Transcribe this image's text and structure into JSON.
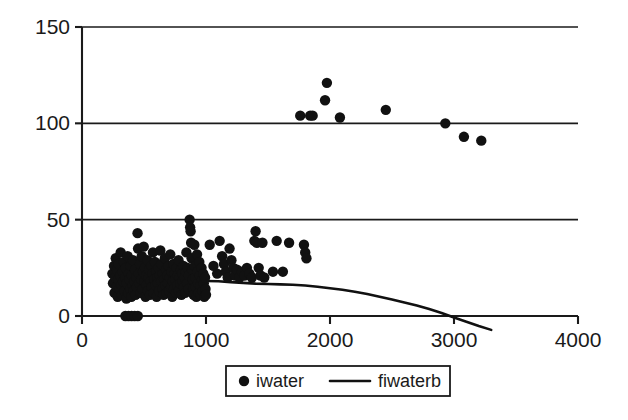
{
  "chart_data": {
    "type": "scatter",
    "title": "",
    "xlabel": "",
    "ylabel": "",
    "xlim": [
      0,
      4000
    ],
    "ylim": [
      0,
      150
    ],
    "grid": true,
    "legend_position": "bottom",
    "x_ticks": [
      0,
      1000,
      2000,
      3000,
      4000
    ],
    "x_tick_labels": [
      "0",
      "1000",
      "2000",
      "3000",
      "4000"
    ],
    "y_ticks": [
      0,
      50,
      100,
      150
    ],
    "y_tick_labels": [
      "0",
      "50",
      "100",
      "150"
    ],
    "series": [
      {
        "name": "iwater",
        "type": "scatter",
        "marker": "filled-circle",
        "color": "#111111",
        "points": [
          [
            245,
            22
          ],
          [
            250,
            17
          ],
          [
            258,
            26
          ],
          [
            262,
            12
          ],
          [
            268,
            20
          ],
          [
            272,
            30
          ],
          [
            278,
            15
          ],
          [
            283,
            24
          ],
          [
            288,
            10
          ],
          [
            292,
            19
          ],
          [
            297,
            27
          ],
          [
            302,
            14
          ],
          [
            308,
            21
          ],
          [
            312,
            33
          ],
          [
            318,
            16
          ],
          [
            322,
            11
          ],
          [
            328,
            23
          ],
          [
            332,
            18
          ],
          [
            338,
            28
          ],
          [
            342,
            13
          ],
          [
            348,
            20
          ],
          [
            352,
            25
          ],
          [
            358,
            9
          ],
          [
            362,
            17
          ],
          [
            368,
            31
          ],
          [
            372,
            12
          ],
          [
            378,
            22
          ],
          [
            382,
            19
          ],
          [
            388,
            14
          ],
          [
            392,
            26
          ],
          [
            398,
            10
          ],
          [
            402,
            21
          ],
          [
            408,
            16
          ],
          [
            412,
            29
          ],
          [
            418,
            13
          ],
          [
            422,
            18
          ],
          [
            428,
            24
          ],
          [
            432,
            11
          ],
          [
            438,
            20
          ],
          [
            442,
            15
          ],
          [
            448,
            43
          ],
          [
            452,
            35
          ],
          [
            458,
            22
          ],
          [
            462,
            17
          ],
          [
            468,
            27
          ],
          [
            472,
            12
          ],
          [
            478,
            19
          ],
          [
            482,
            31
          ],
          [
            488,
            14
          ],
          [
            492,
            23
          ],
          [
            498,
            36
          ],
          [
            502,
            18
          ],
          [
            508,
            25
          ],
          [
            512,
            10
          ],
          [
            518,
            21
          ],
          [
            522,
            16
          ],
          [
            528,
            29
          ],
          [
            532,
            13
          ],
          [
            538,
            20
          ],
          [
            542,
            24
          ],
          [
            548,
            11
          ],
          [
            552,
            18
          ],
          [
            558,
            26
          ],
          [
            562,
            15
          ],
          [
            568,
            22
          ],
          [
            572,
            33
          ],
          [
            578,
            12
          ],
          [
            582,
            19
          ],
          [
            588,
            28
          ],
          [
            592,
            16
          ],
          [
            598,
            23
          ],
          [
            602,
            10
          ],
          [
            608,
            20
          ],
          [
            612,
            17
          ],
          [
            618,
            25
          ],
          [
            622,
            13
          ],
          [
            628,
            21
          ],
          [
            632,
            34
          ],
          [
            638,
            18
          ],
          [
            642,
            27
          ],
          [
            648,
            14
          ],
          [
            652,
            22
          ],
          [
            658,
            11
          ],
          [
            662,
            19
          ],
          [
            668,
            30
          ],
          [
            672,
            16
          ],
          [
            678,
            24
          ],
          [
            682,
            12
          ],
          [
            688,
            21
          ],
          [
            692,
            17
          ],
          [
            698,
            26
          ],
          [
            702,
            13
          ],
          [
            708,
            20
          ],
          [
            712,
            32
          ],
          [
            718,
            15
          ],
          [
            722,
            23
          ],
          [
            728,
            10
          ],
          [
            732,
            18
          ],
          [
            738,
            27
          ],
          [
            742,
            14
          ],
          [
            748,
            22
          ],
          [
            752,
            19
          ],
          [
            758,
            12
          ],
          [
            762,
            25
          ],
          [
            768,
            16
          ],
          [
            772,
            21
          ],
          [
            778,
            29
          ],
          [
            782,
            13
          ],
          [
            788,
            20
          ],
          [
            792,
            17
          ],
          [
            798,
            24
          ],
          [
            802,
            11
          ],
          [
            808,
            22
          ],
          [
            812,
            18
          ],
          [
            818,
            26
          ],
          [
            822,
            15
          ],
          [
            828,
            20
          ],
          [
            832,
            12
          ],
          [
            838,
            23
          ],
          [
            842,
            33
          ],
          [
            848,
            17
          ],
          [
            852,
            25
          ],
          [
            858,
            14
          ],
          [
            862,
            21
          ],
          [
            868,
            50
          ],
          [
            872,
            46
          ],
          [
            876,
            44
          ],
          [
            880,
            38
          ],
          [
            884,
            30
          ],
          [
            888,
            24
          ],
          [
            892,
            19
          ],
          [
            896,
            14
          ],
          [
            900,
            11
          ],
          [
            906,
            37
          ],
          [
            910,
            26
          ],
          [
            914,
            20
          ],
          [
            918,
            15
          ],
          [
            922,
            10
          ],
          [
            928,
            32
          ],
          [
            932,
            23
          ],
          [
            936,
            17
          ],
          [
            940,
            12
          ],
          [
            946,
            28
          ],
          [
            950,
            21
          ],
          [
            954,
            16
          ],
          [
            958,
            11
          ],
          [
            964,
            25
          ],
          [
            968,
            19
          ],
          [
            972,
            13
          ],
          [
            978,
            22
          ],
          [
            982,
            17
          ],
          [
            986,
            10
          ],
          [
            992,
            20
          ],
          [
            996,
            14
          ],
          [
            1000,
            11
          ],
          [
            350,
            0
          ],
          [
            375,
            0
          ],
          [
            400,
            0
          ],
          [
            425,
            0
          ],
          [
            450,
            0
          ],
          [
            1030,
            37
          ],
          [
            1060,
            26
          ],
          [
            1090,
            22
          ],
          [
            1110,
            39
          ],
          [
            1130,
            31
          ],
          [
            1145,
            27
          ],
          [
            1160,
            23
          ],
          [
            1175,
            20
          ],
          [
            1190,
            35
          ],
          [
            1205,
            29
          ],
          [
            1220,
            25
          ],
          [
            1235,
            21
          ],
          [
            1250,
            24
          ],
          [
            1270,
            20
          ],
          [
            1290,
            23
          ],
          [
            1310,
            21
          ],
          [
            1330,
            25
          ],
          [
            1350,
            22
          ],
          [
            1370,
            20
          ],
          [
            1390,
            39
          ],
          [
            1400,
            44
          ],
          [
            1410,
            38
          ],
          [
            1425,
            25
          ],
          [
            1440,
            21
          ],
          [
            1455,
            38
          ],
          [
            1470,
            20
          ],
          [
            1540,
            23
          ],
          [
            1570,
            39
          ],
          [
            1620,
            23
          ],
          [
            1670,
            38
          ],
          [
            1790,
            37
          ],
          [
            1800,
            33
          ],
          [
            1810,
            30
          ],
          [
            1760,
            104
          ],
          [
            1840,
            104
          ],
          [
            1860,
            104
          ],
          [
            1960,
            112
          ],
          [
            1975,
            121
          ],
          [
            2080,
            103
          ],
          [
            2450,
            107
          ],
          [
            2930,
            100
          ],
          [
            3080,
            93
          ],
          [
            3220,
            91
          ]
        ]
      },
      {
        "name": "fiwaterb",
        "type": "line",
        "color": "#111111",
        "points": [
          [
            1000,
            18.2
          ],
          [
            1100,
            18.0
          ],
          [
            1200,
            17.6
          ],
          [
            1300,
            17.2
          ],
          [
            1400,
            16.8
          ],
          [
            1500,
            16.6
          ],
          [
            1600,
            16.4
          ],
          [
            1700,
            16.2
          ],
          [
            1800,
            15.8
          ],
          [
            1900,
            15.2
          ],
          [
            2000,
            14.4
          ],
          [
            2100,
            13.6
          ],
          [
            2200,
            12.6
          ],
          [
            2300,
            11.4
          ],
          [
            2400,
            10.0
          ],
          [
            2500,
            8.6
          ],
          [
            2600,
            7.0
          ],
          [
            2700,
            5.4
          ],
          [
            2800,
            3.6
          ],
          [
            2900,
            1.6
          ],
          [
            2950,
            0.4
          ],
          [
            3000,
            -0.8
          ],
          [
            3100,
            -3.0
          ],
          [
            3200,
            -5.2
          ],
          [
            3300,
            -7.2
          ]
        ]
      }
    ],
    "legend": [
      {
        "label": "iwater",
        "marker": "filled-circle",
        "color": "#111111"
      },
      {
        "label": "fiwaterb",
        "marker": "line",
        "color": "#111111"
      }
    ]
  }
}
